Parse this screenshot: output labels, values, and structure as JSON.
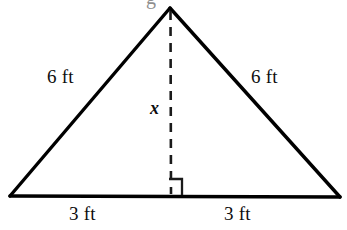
{
  "figure": {
    "type": "isosceles-triangle-with-altitude",
    "background_color": "#ffffff",
    "stroke_color": "#000000",
    "clipped_top_text": "g",
    "geometry": {
      "apex": [
        170,
        8
      ],
      "base_left": [
        10,
        196
      ],
      "base_right": [
        340,
        197
      ],
      "altitude_foot": [
        171,
        196
      ],
      "altitude_top": [
        170,
        10
      ],
      "right_angle_marker": {
        "x": 169,
        "y": 179,
        "size": 13
      }
    },
    "labels": {
      "side_left": "6 ft",
      "side_right": "6 ft",
      "altitude": "x",
      "base_left": "3 ft",
      "base_right": "3 ft"
    }
  }
}
